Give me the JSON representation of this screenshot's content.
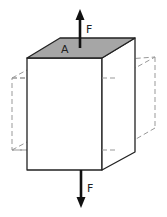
{
  "diagram": {
    "labels": {
      "force_top": "F",
      "area": "A",
      "force_bottom": "F"
    },
    "colors": {
      "top_face": "#a6a6a6",
      "edge": "#222222",
      "dashed": "#999999",
      "arrow": "#111111"
    },
    "elements": [
      {
        "type": "solid-box",
        "description": "original block, stretched vertically"
      },
      {
        "type": "dashed-box",
        "description": "reference/deformed outline, wider and shorter"
      },
      {
        "type": "arrow",
        "direction": "up",
        "label": "F"
      },
      {
        "type": "arrow",
        "direction": "down",
        "label": "F"
      },
      {
        "type": "shaded-face",
        "label": "A"
      }
    ]
  }
}
